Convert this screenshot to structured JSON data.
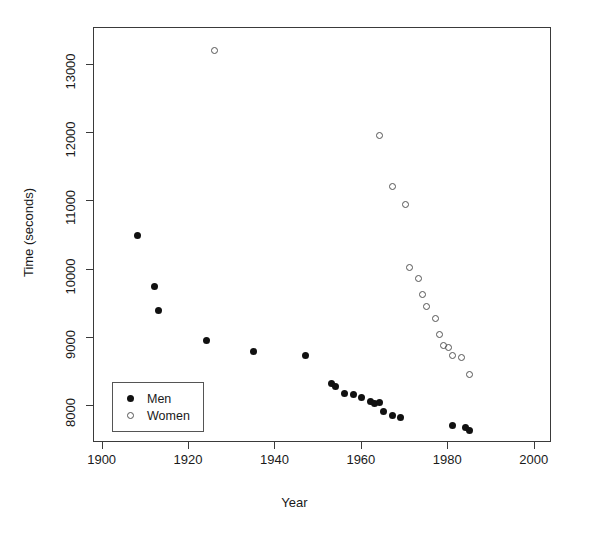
{
  "chart_data": {
    "type": "scatter",
    "title": "",
    "xlabel": "Year",
    "ylabel": "Time (seconds)",
    "xlim": [
      1898,
      2004
    ],
    "ylim": [
      7450,
      13550
    ],
    "xticks": [
      1900,
      1920,
      1940,
      1960,
      1980,
      2000
    ],
    "xtick_labels": [
      "1900",
      "1920",
      "1940",
      "1960",
      "1980",
      "2000"
    ],
    "yticks": [
      8000,
      9000,
      10000,
      11000,
      12000,
      13000
    ],
    "ytick_labels": [
      "8000",
      "9000",
      "10000",
      "11000",
      "12000",
      "13000"
    ],
    "grid": false,
    "legend_position": "bottom-left",
    "series": [
      {
        "name": "Men",
        "marker": "filled-circle",
        "color": "#111111",
        "points": [
          {
            "x": 1908,
            "y": 10500
          },
          {
            "x": 1912,
            "y": 9750
          },
          {
            "x": 1913,
            "y": 9400
          },
          {
            "x": 1924,
            "y": 8950
          },
          {
            "x": 1935,
            "y": 8800
          },
          {
            "x": 1947,
            "y": 8730
          },
          {
            "x": 1953,
            "y": 8330
          },
          {
            "x": 1954,
            "y": 8280
          },
          {
            "x": 1956,
            "y": 8180
          },
          {
            "x": 1958,
            "y": 8170
          },
          {
            "x": 1960,
            "y": 8120
          },
          {
            "x": 1962,
            "y": 8060
          },
          {
            "x": 1963,
            "y": 8030
          },
          {
            "x": 1964,
            "y": 8040
          },
          {
            "x": 1965,
            "y": 7920
          },
          {
            "x": 1967,
            "y": 7860
          },
          {
            "x": 1969,
            "y": 7820
          },
          {
            "x": 1981,
            "y": 7700
          },
          {
            "x": 1984,
            "y": 7680
          },
          {
            "x": 1985,
            "y": 7640
          }
        ]
      },
      {
        "name": "Women",
        "marker": "open-circle",
        "color": "#555555",
        "points": [
          {
            "x": 1926,
            "y": 13220
          },
          {
            "x": 1964,
            "y": 11970
          },
          {
            "x": 1967,
            "y": 11220
          },
          {
            "x": 1970,
            "y": 10950
          },
          {
            "x": 1971,
            "y": 10030
          },
          {
            "x": 1973,
            "y": 9870
          },
          {
            "x": 1974,
            "y": 9630
          },
          {
            "x": 1975,
            "y": 9450
          },
          {
            "x": 1977,
            "y": 9280
          },
          {
            "x": 1978,
            "y": 9050
          },
          {
            "x": 1979,
            "y": 8880
          },
          {
            "x": 1980,
            "y": 8850
          },
          {
            "x": 1981,
            "y": 8730
          },
          {
            "x": 1983,
            "y": 8700
          },
          {
            "x": 1985,
            "y": 8460
          }
        ]
      }
    ]
  },
  "legend": {
    "entries": [
      {
        "label": "Men",
        "marker": "filled-circle"
      },
      {
        "label": "Women",
        "marker": "open-circle"
      }
    ]
  }
}
